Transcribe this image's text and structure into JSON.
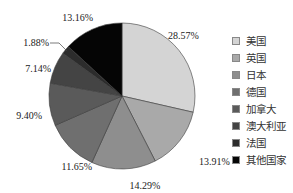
{
  "chart_data": {
    "type": "pie",
    "title": "",
    "start_angle": "12 o'clock",
    "direction": "clockwise",
    "categories": [
      "美国",
      "英国",
      "日本",
      "德国",
      "加拿大",
      "澳大利亚",
      "法国",
      "其他国家"
    ],
    "values": [
      28.57,
      13.91,
      14.29,
      11.65,
      9.4,
      7.14,
      1.88,
      13.16
    ],
    "labels": [
      "28.57%",
      "13.91%",
      "14.29%",
      "11.65%",
      "9.40%",
      "7.14%",
      "1.88%",
      "13.16%"
    ],
    "colors": [
      "#d4d4d4",
      "#a9a9a9",
      "#8e8e8e",
      "#6f6f6f",
      "#5a5a5a",
      "#444444",
      "#2c2c2c",
      "#050505"
    ],
    "legend_position": "right"
  },
  "legend": {
    "items": [
      {
        "label": "美国"
      },
      {
        "label": "英国"
      },
      {
        "label": "日本"
      },
      {
        "label": "德国"
      },
      {
        "label": "加拿大"
      },
      {
        "label": "澳大利亚"
      },
      {
        "label": "法国"
      },
      {
        "label": "其他国家"
      }
    ]
  }
}
